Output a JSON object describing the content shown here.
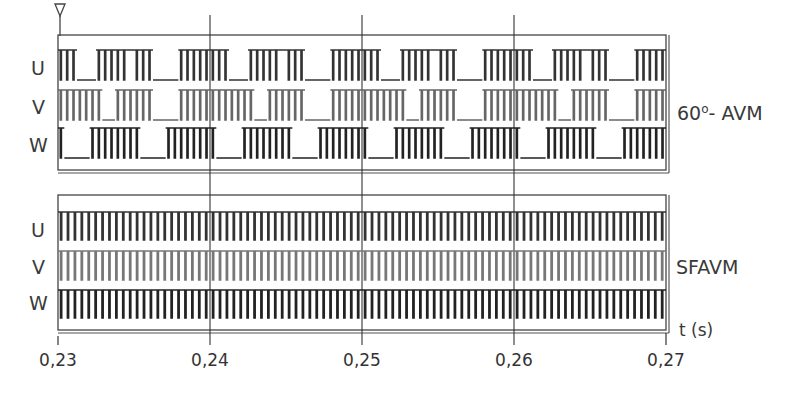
{
  "chart_data": {
    "type": "line",
    "title": "",
    "xlabel": "t (s)",
    "ylabel": "",
    "xlim": [
      0.23,
      0.27
    ],
    "x_ticks": [
      "0,23",
      "0,24",
      "0,25",
      "0,26",
      "0,27"
    ],
    "grid": {
      "vertical_lines_at": [
        0.24,
        0.25,
        0.26
      ]
    },
    "fundamental_period_s": 0.01,
    "panels": [
      {
        "name": "60°- AVM",
        "label_main": "60",
        "label_sup": "o",
        "label_rest": "- AVM",
        "signals": [
          "U",
          "V",
          "W"
        ],
        "description": "Discontinuous PWM: each phase clamped for 60° intervals, switching elsewhere",
        "pulses_per_switching_segment": 8,
        "segments": {
          "U": [
            {
              "from": 0.0,
              "to": 0.12,
              "state": "pwm"
            },
            {
              "from": 0.12,
              "to": 0.23,
              "state": "high-off"
            },
            {
              "from": 0.23,
              "to": 0.42,
              "state": "pwm"
            },
            {
              "from": 0.42,
              "to": 0.46,
              "state": "high"
            },
            {
              "from": 0.46,
              "to": 0.62,
              "state": "pwm"
            },
            {
              "from": 0.62,
              "to": 0.78,
              "state": "low"
            },
            {
              "from": 0.78,
              "to": 1.0,
              "state": "pwm"
            }
          ],
          "V": [
            {
              "from": 0.0,
              "to": 0.28,
              "state": "pwm"
            },
            {
              "from": 0.28,
              "to": 0.36,
              "state": "low"
            },
            {
              "from": 0.36,
              "to": 0.62,
              "state": "pwm"
            },
            {
              "from": 0.62,
              "to": 0.78,
              "state": "high-off"
            },
            {
              "from": 0.78,
              "to": 1.0,
              "state": "pwm"
            }
          ],
          "W": [
            {
              "from": 0.0,
              "to": 0.04,
              "state": "pwm"
            },
            {
              "from": 0.04,
              "to": 0.2,
              "state": "low"
            },
            {
              "from": 0.2,
              "to": 0.52,
              "state": "pwm"
            },
            {
              "from": 0.52,
              "to": 0.68,
              "state": "high-off"
            },
            {
              "from": 0.68,
              "to": 1.0,
              "state": "pwm"
            }
          ]
        }
      },
      {
        "name": "SFAVM",
        "label_main": "SFAVM",
        "signals": [
          "U",
          "V",
          "W"
        ],
        "description": "Continuous symmetric space-vector PWM, all phases switching throughout",
        "pulses_per_period": 22
      }
    ],
    "legend": []
  },
  "labels": {
    "top": {
      "U": "U",
      "V": "V",
      "W": "W"
    },
    "bottom": {
      "U": "U",
      "V": "V",
      "W": "W"
    },
    "x_axis_unit": "t (s)",
    "panel_top": {
      "main": "60",
      "sup": "o",
      "rest": "- AVM"
    },
    "panel_bottom": "SFAVM"
  },
  "colors": {
    "line": "#333333",
    "frame": "#444444",
    "bg": "#ffffff"
  }
}
